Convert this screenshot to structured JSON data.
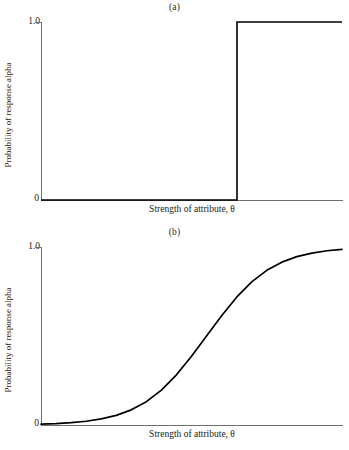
{
  "chart_data": [
    {
      "type": "line",
      "title": "(a)",
      "xlabel": "Strength of attribute, θ",
      "ylabel": "Probability of response alpha",
      "ytick_labels": [
        "1.0",
        "0"
      ],
      "ytick_values": [
        1.0,
        0
      ],
      "ylim": [
        0,
        1.0
      ],
      "xlim": [
        0,
        1.0
      ],
      "grid": false,
      "legend": null,
      "series": [
        {
          "name": "Guttman step function",
          "description": "Deterministic step: probability 0 below threshold, 1.0 at and above threshold",
          "threshold_x": 0.65,
          "x": [
            0.0,
            0.65,
            0.65,
            1.0
          ],
          "y": [
            0.0,
            0.0,
            1.0,
            1.0
          ]
        }
      ]
    },
    {
      "type": "line",
      "title": "(b)",
      "xlabel": "Strength of attribute, θ",
      "ylabel": "Probability of response alpha",
      "ytick_labels": [
        "1.0",
        "0"
      ],
      "ytick_values": [
        1.0,
        0
      ],
      "ylim": [
        0,
        1.0
      ],
      "xlim": [
        0,
        1.0
      ],
      "grid": false,
      "legend": null,
      "series": [
        {
          "name": "Logistic item characteristic curve",
          "description": "Smooth ogive rising from 0 to 1.0",
          "inflection_x": 0.52,
          "x": [
            0.0,
            0.05,
            0.1,
            0.15,
            0.2,
            0.25,
            0.3,
            0.35,
            0.4,
            0.45,
            0.5,
            0.55,
            0.6,
            0.65,
            0.7,
            0.75,
            0.8,
            0.85,
            0.9,
            0.95,
            1.0
          ],
          "y": [
            0.005,
            0.008,
            0.013,
            0.021,
            0.034,
            0.054,
            0.085,
            0.131,
            0.196,
            0.282,
            0.386,
            0.5,
            0.614,
            0.718,
            0.804,
            0.869,
            0.915,
            0.946,
            0.966,
            0.979,
            0.987
          ]
        }
      ]
    }
  ],
  "panel_a": {
    "label": "(a)",
    "ytick_top": "1.0",
    "ytick_bottom": "0",
    "xlabel": "Strength of attribute, θ",
    "ylabel": "Probability of response alpha"
  },
  "panel_b": {
    "label": "(b)",
    "ytick_top": "1.0",
    "ytick_bottom": "0",
    "xlabel": "Strength of attribute, θ",
    "ylabel": "Probability of response alpha"
  },
  "colors": {
    "line": "#000000",
    "axis": "#6f6f6f",
    "background": "#ffffff",
    "text": "#1a1a1a"
  }
}
